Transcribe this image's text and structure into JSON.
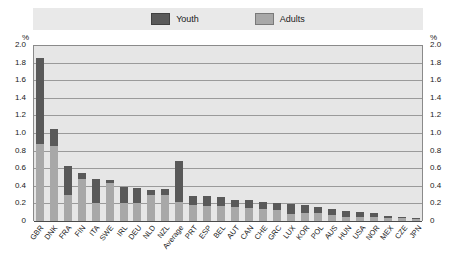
{
  "legend": {
    "items": [
      {
        "label": "Youth",
        "color": "#595959",
        "name": "legend-youth"
      },
      {
        "label": "Adults",
        "color": "#a8a8a8",
        "name": "legend-adults"
      }
    ]
  },
  "axis": {
    "unit_left": "%",
    "unit_right": "%",
    "ticks": [
      "2.0",
      "1.8",
      "1.6",
      "1.4",
      "1.2",
      "1.0",
      "0.8",
      "0.6",
      "0.4",
      "0.2",
      "0"
    ]
  },
  "chart_data": {
    "type": "bar",
    "subtype": "stacked-column",
    "title": "",
    "xlabel": "",
    "ylabel": "%",
    "ylim": [
      0,
      2.0
    ],
    "ytick_step": 0.2,
    "grid": true,
    "legend_position": "top",
    "categories": [
      "GBR",
      "DNK",
      "FRA",
      "FIN",
      "ITA",
      "SWE",
      "IRL",
      "DEU",
      "NLD",
      "NZL",
      "Average",
      "PRT",
      "ESP",
      "BEL",
      "AUT",
      "CAN",
      "CHE",
      "GRC",
      "LUX",
      "KOR",
      "POL",
      "AUS",
      "HUN",
      "USA",
      "NOR",
      "MEX",
      "CZE",
      "JPN"
    ],
    "series": [
      {
        "name": "Adults",
        "color": "#a8a8a8",
        "values": [
          0.88,
          0.85,
          0.3,
          0.48,
          0.21,
          0.43,
          0.21,
          0.21,
          0.3,
          0.3,
          0.22,
          0.18,
          0.17,
          0.17,
          0.16,
          0.15,
          0.14,
          0.13,
          0.08,
          0.09,
          0.09,
          0.07,
          0.05,
          0.05,
          0.05,
          0.03,
          0.03,
          0.02
        ]
      },
      {
        "name": "Youth",
        "color": "#595959",
        "values": [
          0.97,
          0.19,
          0.33,
          0.07,
          0.27,
          0.04,
          0.18,
          0.16,
          0.05,
          0.06,
          0.46,
          0.11,
          0.11,
          0.1,
          0.08,
          0.09,
          0.08,
          0.07,
          0.11,
          0.09,
          0.07,
          0.07,
          0.06,
          0.05,
          0.04,
          0.03,
          0.02,
          0.02
        ]
      }
    ],
    "totals": [
      1.85,
      1.04,
      0.63,
      0.55,
      0.48,
      0.47,
      0.39,
      0.37,
      0.35,
      0.36,
      0.68,
      0.29,
      0.28,
      0.27,
      0.24,
      0.24,
      0.22,
      0.2,
      0.19,
      0.18,
      0.16,
      0.14,
      0.11,
      0.1,
      0.09,
      0.06,
      0.05,
      0.04
    ]
  }
}
